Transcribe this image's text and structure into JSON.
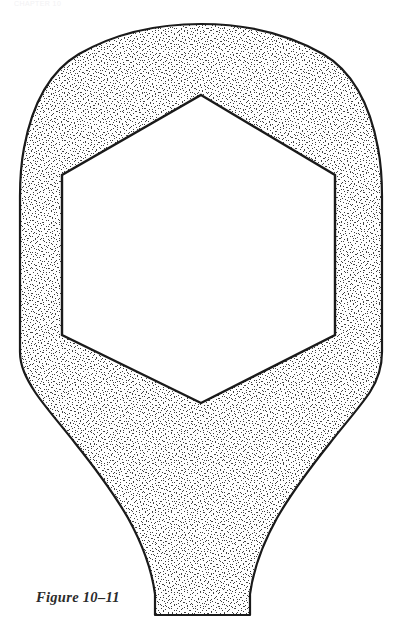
{
  "page": {
    "background_color": "#ffffff",
    "width": 401,
    "height": 640,
    "running_head": "CHAPTER 10"
  },
  "caption": {
    "text": "Figure 10–11",
    "color": "#2b2b2b"
  },
  "figure": {
    "name": "stippled-bulb-with-hexagonal-void",
    "stroke_color": "#1a1a1a",
    "stroke_width": 2.2,
    "fill_color": "#ffffff",
    "stipple_color": "#3a3a3a",
    "void_fill_color": "#ffffff",
    "outer_outline_points": "201,24 246,26 288,36 323,54 351,79 370,112 379,150 382,196 382,352 379,378 370,400 352,424 318,462 287,502 262,546 250,584 250,615 155,615 155,584 146,548 124,506 94,466 56,422 35,396 25,374 20,350 19,196 22,152 31,113 50,79 78,54 113,36 156,26",
    "hexagon_points": "201,95 335,175 335,335 201,403 62,335 62,175",
    "hexagon_vertices": [
      {
        "name": "top-apex",
        "x": 201,
        "y": 95
      },
      {
        "name": "upper-right",
        "x": 335,
        "y": 175
      },
      {
        "name": "lower-right",
        "x": 335,
        "y": 335
      },
      {
        "name": "bottom-apex",
        "x": 201,
        "y": 403
      },
      {
        "name": "lower-left",
        "x": 62,
        "y": 335
      },
      {
        "name": "upper-left",
        "x": 62,
        "y": 175
      }
    ]
  }
}
